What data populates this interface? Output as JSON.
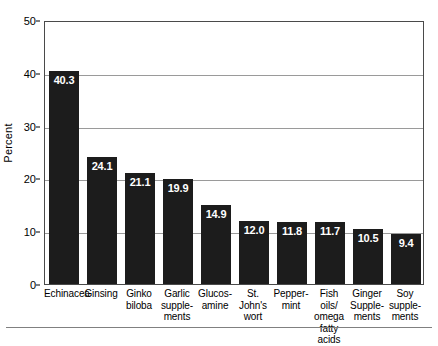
{
  "chart_data": {
    "type": "bar",
    "title": "",
    "subtitle": "",
    "xlabel": "",
    "ylabel": "Percent",
    "ylim": [
      0,
      50
    ],
    "yticks": [
      0,
      10,
      20,
      30,
      40,
      50
    ],
    "ytick_labels": [
      "0",
      "10",
      "20",
      "30",
      "40",
      "50"
    ],
    "grid": "horizontal",
    "legend": "none",
    "bar_color": "#1c1c1c",
    "value_label_color": "#ffffff",
    "gridline_color": "#9a9a9a",
    "axis_color": "#4a4a4a",
    "categories": [
      "Echinacea",
      "Ginsing",
      "Ginko\nbiloba",
      "Garlic\nsupple-\nments",
      "Glucos-\namine",
      "St. John's\nwort",
      "Pepper-\nmint",
      "Fish oils/\nomega\nfatty acids",
      "Ginger\nSupple-\nments",
      "Soy\nsupple-\nments"
    ],
    "values": [
      40.3,
      24.1,
      21.1,
      19.9,
      14.9,
      12.0,
      11.8,
      11.7,
      10.5,
      9.4
    ],
    "value_labels": [
      "40.3",
      "24.1",
      "21.1",
      "19.9",
      "14.9",
      "12.0",
      "11.8",
      "11.7",
      "10.5",
      "9.4"
    ]
  }
}
